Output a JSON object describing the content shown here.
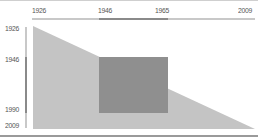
{
  "chart": {
    "title": "",
    "type": "triangle-timeline",
    "top_axis": {
      "range": [
        1926,
        2009
      ],
      "ticks": [
        "1926",
        "1946",
        "1965",
        "2009"
      ],
      "highlight": [
        "1946",
        "1965"
      ]
    },
    "left_axis": {
      "range": [
        1926,
        2009
      ],
      "ticks": [
        "1926",
        "1946",
        "1990",
        "2009"
      ],
      "highlight": [
        "1946",
        "1990"
      ]
    },
    "regions": [
      {
        "name": "full-span-triangle",
        "x_from": 1926,
        "x_to": 2009,
        "y_from": 1926,
        "y_to": 2009,
        "color": "#c4c4c4"
      },
      {
        "name": "highlight-rect",
        "x_from": 1946,
        "x_to": 1965,
        "y_from": 1946,
        "y_to": 1990,
        "color": "#8f8f8f"
      }
    ],
    "colors": {
      "triangle": "#c4c4c4",
      "rect": "#8f8f8f",
      "axis": "#c8c8c8",
      "axis_highlight": "#8a8a8a",
      "text": "#555555"
    }
  }
}
